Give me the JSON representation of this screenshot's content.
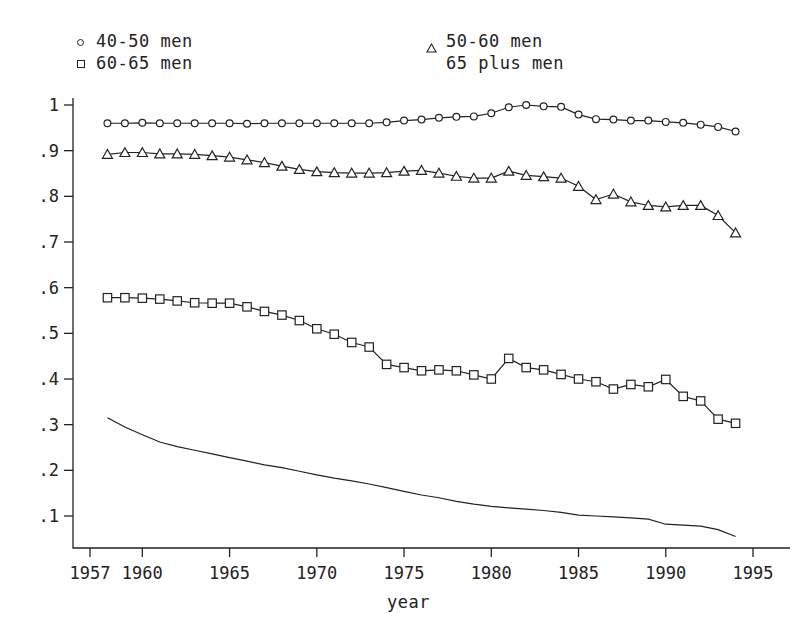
{
  "chart_data": {
    "type": "line",
    "title": "",
    "xlabel": "year",
    "ylabel": "",
    "xlim": [
      1957,
      1995
    ],
    "ylim": [
      0,
      1.04
    ],
    "grid": false,
    "legend_position": "top",
    "xticks": [
      1957,
      1960,
      1965,
      1970,
      1975,
      1980,
      1985,
      1990,
      1995
    ],
    "xticklabels": [
      "1957",
      "1960",
      "1965",
      "1970",
      "1975",
      "1980",
      "1985",
      "1990",
      "1995"
    ],
    "yticks": [
      0.1,
      0.2,
      0.3,
      0.4,
      0.5,
      0.6,
      0.7,
      0.8,
      0.9,
      1.0
    ],
    "yticklabels": [
      ".1",
      ".2",
      ".3",
      ".4",
      ".5",
      ".6",
      ".7",
      ".8",
      ".9",
      "1"
    ],
    "x": [
      1958,
      1959,
      1960,
      1961,
      1962,
      1963,
      1964,
      1965,
      1966,
      1967,
      1968,
      1969,
      1970,
      1971,
      1972,
      1973,
      1974,
      1975,
      1976,
      1977,
      1978,
      1979,
      1980,
      1981,
      1982,
      1983,
      1984,
      1985,
      1986,
      1987,
      1988,
      1989,
      1990,
      1991,
      1992,
      1993,
      1994
    ],
    "series": [
      {
        "name": "40-50 men",
        "marker": "circle",
        "color": "#222222",
        "values": [
          0.96,
          0.96,
          0.961,
          0.96,
          0.96,
          0.96,
          0.96,
          0.96,
          0.959,
          0.96,
          0.96,
          0.96,
          0.96,
          0.96,
          0.96,
          0.96,
          0.962,
          0.966,
          0.968,
          0.972,
          0.974,
          0.975,
          0.982,
          0.995,
          1.0,
          0.997,
          0.996,
          0.979,
          0.969,
          0.968,
          0.966,
          0.966,
          0.963,
          0.961,
          0.957,
          0.952,
          0.942
        ]
      },
      {
        "name": "50-60 men",
        "marker": "triangle",
        "color": "#222222",
        "values": [
          0.892,
          0.896,
          0.896,
          0.893,
          0.893,
          0.892,
          0.889,
          0.886,
          0.88,
          0.874,
          0.866,
          0.859,
          0.854,
          0.852,
          0.851,
          0.851,
          0.852,
          0.855,
          0.857,
          0.851,
          0.844,
          0.84,
          0.84,
          0.855,
          0.846,
          0.843,
          0.84,
          0.822,
          0.793,
          0.805,
          0.788,
          0.78,
          0.777,
          0.78,
          0.78,
          0.758,
          0.72
        ]
      },
      {
        "name": "60-65 men",
        "marker": "square",
        "color": "#222222",
        "values": [
          0.578,
          0.578,
          0.577,
          0.575,
          0.571,
          0.567,
          0.566,
          0.566,
          0.558,
          0.548,
          0.54,
          0.528,
          0.51,
          0.498,
          0.48,
          0.47,
          0.432,
          0.425,
          0.418,
          0.42,
          0.418,
          0.409,
          0.4,
          0.445,
          0.425,
          0.42,
          0.41,
          0.4,
          0.394,
          0.378,
          0.388,
          0.383,
          0.399,
          0.383,
          0.373,
          0.363,
          0.358
        ]
      },
      {
        "name": "65 plus men",
        "marker": "none",
        "color": "#222222",
        "values": [
          0.315,
          0.295,
          0.278,
          0.262,
          0.252,
          0.244,
          0.236,
          0.228,
          0.22,
          0.212,
          0.206,
          0.198,
          0.19,
          0.183,
          0.177,
          0.17,
          0.162,
          0.154,
          0.146,
          0.14,
          0.132,
          0.126,
          0.121,
          0.118,
          0.115,
          0.112,
          0.108,
          0.102,
          0.1,
          0.098,
          0.096,
          0.093,
          0.09,
          0.087,
          0.082,
          0.076,
          0.07
        ]
      }
    ],
    "extra_points_60_65": {
      "note": "late tail",
      "x": [
        1991,
        1992,
        1993,
        1994
      ],
      "values": [
        0.362,
        0.352,
        0.312,
        0.303
      ]
    },
    "extra_points_65_plus": {
      "note": "late tail",
      "x": [
        1990,
        1991,
        1992,
        1993,
        1994
      ],
      "values": [
        0.082,
        0.08,
        0.078,
        0.07,
        0.055
      ]
    }
  },
  "legend": {
    "items": [
      {
        "label": "40-50 men",
        "marker": "circle"
      },
      {
        "label": "50-60 men",
        "marker": "triangle"
      },
      {
        "label": "60-65 men",
        "marker": "square"
      },
      {
        "label": "65 plus men",
        "marker": "none"
      }
    ]
  },
  "axis": {
    "xlabel": "year"
  }
}
